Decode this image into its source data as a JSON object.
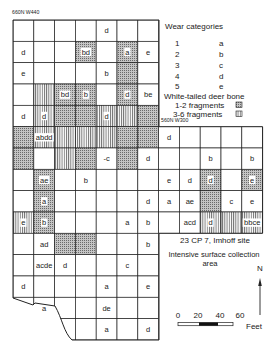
{
  "labels": {
    "grid_nw_corner": "660N W440",
    "grid_se_block_corner": "560N W300"
  },
  "legend": {
    "title": "Wear categories",
    "categories": [
      {
        "num": "1",
        "letter": "a"
      },
      {
        "num": "2",
        "letter": "b"
      },
      {
        "num": "3",
        "letter": "c"
      },
      {
        "num": "4",
        "letter": "d"
      },
      {
        "num": "5",
        "letter": "e"
      }
    ],
    "bone_title": "White-tailed deer bone",
    "fragments": [
      {
        "label": "1-2 fragments",
        "pattern": "stipple"
      },
      {
        "label": "3-6 fragments",
        "pattern": "hatch"
      }
    ]
  },
  "site": {
    "name": "23 CP 7, Imhoff site",
    "desc_line1": "Intensive surface collection",
    "desc_line2": "area"
  },
  "north_arrow": {
    "label": "N"
  },
  "scale_bar": {
    "ticks": [
      "0",
      "20",
      "40",
      "60"
    ],
    "unit": "Feet"
  },
  "colors": {
    "ink": "#222222",
    "stipple_bg": "#bdbdbd",
    "paper": "#ffffff"
  },
  "grid": {
    "cells": [
      {
        "r": 1,
        "c": 5,
        "t": "d"
      },
      {
        "r": 2,
        "c": 1,
        "t": "d"
      },
      {
        "r": 2,
        "c": 4,
        "t": "bd",
        "f": "stipple"
      },
      {
        "r": 2,
        "c": 6,
        "t": "a",
        "f": "stipple"
      },
      {
        "r": 2,
        "c": 7,
        "t": "e"
      },
      {
        "r": 3,
        "c": 1,
        "t": "e"
      },
      {
        "r": 3,
        "c": 5,
        "t": "b"
      },
      {
        "r": 3,
        "c": 6,
        "t": "",
        "f": "stipple"
      },
      {
        "r": 4,
        "c": 2,
        "t": "",
        "f": "hatch"
      },
      {
        "r": 4,
        "c": 3,
        "t": "bd",
        "f": "stipple"
      },
      {
        "r": 4,
        "c": 4,
        "t": "b",
        "f": "stipple"
      },
      {
        "r": 4,
        "c": 6,
        "t": "d",
        "f": "stipple"
      },
      {
        "r": 4,
        "c": 7,
        "t": "be"
      },
      {
        "r": 5,
        "c": 1,
        "t": "d"
      },
      {
        "r": 5,
        "c": 2,
        "t": "d",
        "f": "hatch"
      },
      {
        "r": 5,
        "c": 3,
        "t": "",
        "f": "stipple"
      },
      {
        "r": 5,
        "c": 4,
        "t": "",
        "f": "stipple"
      },
      {
        "r": 5,
        "c": 5,
        "t": "d",
        "f": "hatch"
      },
      {
        "r": 5,
        "c": 6,
        "t": "",
        "f": "hatch"
      },
      {
        "r": 5,
        "c": 7,
        "t": "",
        "f": "stipple"
      },
      {
        "r": 6,
        "c": 1,
        "t": "",
        "f": "stipple"
      },
      {
        "r": 6,
        "c": 2,
        "t": "abdd",
        "f": "hatch"
      },
      {
        "r": 6,
        "c": 3,
        "t": "",
        "f": "hatch"
      },
      {
        "r": 6,
        "c": 4,
        "t": "",
        "f": "hatch"
      },
      {
        "r": 6,
        "c": 5,
        "t": "",
        "f": "hatch"
      },
      {
        "r": 6,
        "c": 6,
        "t": "",
        "f": "stipple"
      },
      {
        "r": 6,
        "c": 7,
        "t": "",
        "f": "stipple"
      },
      {
        "r": 6,
        "c": 8,
        "t": "d"
      },
      {
        "r": 7,
        "c": 1,
        "t": "",
        "f": "stipple"
      },
      {
        "r": 7,
        "c": 3,
        "t": "",
        "f": "hatch"
      },
      {
        "r": 7,
        "c": 4,
        "t": "",
        "f": "stipple"
      },
      {
        "r": 7,
        "c": 5,
        "t": "-c"
      },
      {
        "r": 7,
        "c": 6,
        "t": "",
        "f": "stipple"
      },
      {
        "r": 7,
        "c": 7,
        "t": "d"
      },
      {
        "r": 7,
        "c": 10,
        "t": "b"
      },
      {
        "r": 7,
        "c": 12,
        "t": "b"
      },
      {
        "r": 8,
        "c": 2,
        "t": "ae",
        "f": "stipple"
      },
      {
        "r": 8,
        "c": 4,
        "t": "b"
      },
      {
        "r": 8,
        "c": 8,
        "t": "e"
      },
      {
        "r": 8,
        "c": 9,
        "t": "d"
      },
      {
        "r": 8,
        "c": 10,
        "t": "d",
        "f": "stipple"
      },
      {
        "r": 8,
        "c": 12,
        "t": "e",
        "f": "stipple"
      },
      {
        "r": 9,
        "c": 2,
        "t": "a",
        "f": "stipple"
      },
      {
        "r": 9,
        "c": 7,
        "t": "d"
      },
      {
        "r": 9,
        "c": 8,
        "t": "a"
      },
      {
        "r": 9,
        "c": 9,
        "t": "ae"
      },
      {
        "r": 9,
        "c": 10,
        "t": "",
        "f": "stipple"
      },
      {
        "r": 9,
        "c": 11,
        "t": "c"
      },
      {
        "r": 9,
        "c": 12,
        "t": "e"
      },
      {
        "r": 10,
        "c": 1,
        "t": "e",
        "f": "hatch"
      },
      {
        "r": 10,
        "c": 2,
        "t": "b",
        "f": "stipple"
      },
      {
        "r": 10,
        "c": 6,
        "t": "a"
      },
      {
        "r": 10,
        "c": 7,
        "t": "b"
      },
      {
        "r": 10,
        "c": 9,
        "t": "acd"
      },
      {
        "r": 10,
        "c": 10,
        "t": "d",
        "f": "hatch"
      },
      {
        "r": 10,
        "c": 11,
        "t": "",
        "f": "hatch"
      },
      {
        "r": 10,
        "c": 12,
        "t": "bbce",
        "f": "hatch"
      },
      {
        "r": 11,
        "c": 2,
        "t": "ad"
      },
      {
        "r": 11,
        "c": 3,
        "t": "",
        "f": "stipple"
      },
      {
        "r": 11,
        "c": 4,
        "t": "",
        "f": "stipple"
      },
      {
        "r": 11,
        "c": 7,
        "t": "b"
      },
      {
        "r": 12,
        "c": 2,
        "t": "acde"
      },
      {
        "r": 12,
        "c": 3,
        "t": "d"
      },
      {
        "r": 12,
        "c": 6,
        "t": "c"
      },
      {
        "r": 13,
        "c": 1,
        "t": "d"
      },
      {
        "r": 13,
        "c": 5,
        "t": "a"
      },
      {
        "r": 13,
        "c": 7,
        "t": "e"
      },
      {
        "r": 14,
        "c": 2,
        "t": "a"
      },
      {
        "r": 14,
        "c": 5,
        "t": "de"
      },
      {
        "r": 15,
        "c": 5,
        "t": "a"
      },
      {
        "r": 15,
        "c": 7,
        "t": "d"
      }
    ]
  }
}
